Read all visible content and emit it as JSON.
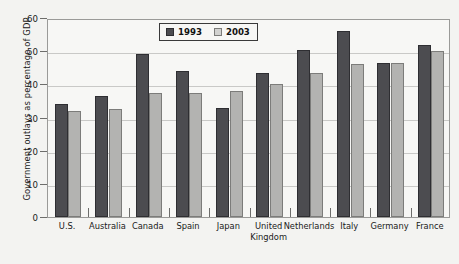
{
  "chart_data": {
    "type": "bar",
    "title": "",
    "xlabel": "",
    "ylabel": "Government outlays as percentage of GDP",
    "ylim": [
      0,
      60
    ],
    "yticks": [
      0,
      10,
      20,
      30,
      40,
      50,
      60
    ],
    "grid": true,
    "legend_position": "top-center",
    "categories": [
      "U.S.",
      "Australia",
      "Canada",
      "Spain",
      "Japan",
      "United\nKingdom",
      "Netherlands",
      "Italy",
      "Germany",
      "France"
    ],
    "series": [
      {
        "name": "1993",
        "color": "#4c4c50",
        "values": [
          34.0,
          36.5,
          49.0,
          44.0,
          33.0,
          43.5,
          50.5,
          56.0,
          46.5,
          52.0
        ]
      },
      {
        "name": "2003",
        "color": "#b3b3b1",
        "values": [
          32.0,
          32.5,
          37.5,
          37.5,
          38.0,
          40.0,
          43.5,
          46.0,
          46.5,
          50.0
        ]
      }
    ]
  },
  "legend": {
    "items": [
      {
        "label": "1993",
        "swatch": "dark-square-swatch"
      },
      {
        "label": "2003",
        "swatch": "light-square-swatch"
      }
    ]
  },
  "axes": {
    "y_title": "Government outlays as percentage of GDP",
    "y_tick_labels": [
      "60",
      "50",
      "40",
      "30",
      "20",
      "10",
      "0"
    ],
    "x_tick_labels": [
      "U.S.",
      "Australia",
      "Canada",
      "Spain",
      "Japan",
      "United\nKingdom",
      "Netherlands",
      "Italy",
      "Germany",
      "France"
    ]
  }
}
